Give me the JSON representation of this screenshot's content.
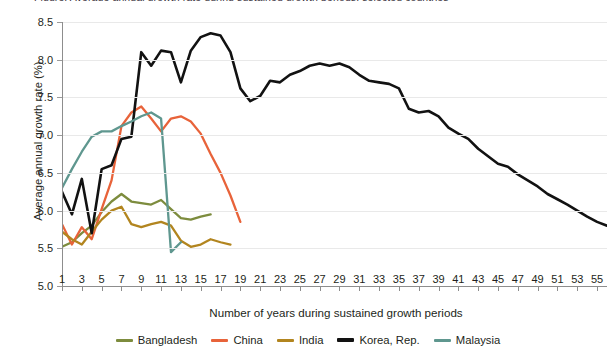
{
  "chart": {
    "title_clipped": "Figure: Average annual growth rate during sustained growth periods, selected countries",
    "xlabel": "Number of years during sustained growth periods",
    "ylabel": "Average annual growth rate (%)",
    "yticks": [
      "5.0",
      "5.5",
      "6.0",
      "6.5",
      "7.0",
      "7.5",
      "8.0",
      "8.5"
    ],
    "xticks": [
      "1",
      "3",
      "5",
      "7",
      "9",
      "11",
      "13",
      "15",
      "17",
      "19",
      "21",
      "23",
      "25",
      "27",
      "29",
      "31",
      "33",
      "35",
      "37",
      "39",
      "41",
      "43",
      "45",
      "47",
      "49",
      "51",
      "53",
      "55"
    ]
  },
  "legend": {
    "items": [
      {
        "label": "Bangladesh",
        "color": "#7d8c3e"
      },
      {
        "label": "China",
        "color": "#e8633a"
      },
      {
        "label": "India",
        "color": "#b2851f"
      },
      {
        "label": "Korea, Rep.",
        "color": "#121212"
      },
      {
        "label": "Malaysia",
        "color": "#5f978f"
      }
    ]
  },
  "chart_data": {
    "type": "line",
    "title": "Average annual growth rate during sustained growth periods, selected countries",
    "xlabel": "Number of years during sustained growth periods",
    "ylabel": "Average annual growth rate (%)",
    "xlim": [
      1,
      56
    ],
    "ylim": [
      5.0,
      8.5
    ],
    "ytick_values": [
      5.0,
      5.5,
      6.0,
      6.5,
      7.0,
      7.5,
      8.0,
      8.5
    ],
    "xtick_values": [
      1,
      3,
      5,
      7,
      9,
      11,
      13,
      15,
      17,
      19,
      21,
      23,
      25,
      27,
      29,
      31,
      33,
      35,
      37,
      39,
      41,
      43,
      45,
      47,
      49,
      51,
      53,
      55
    ],
    "grid": "horizontal",
    "legend_position": "bottom",
    "series": [
      {
        "name": "Bangladesh",
        "color": "#7d8c3e",
        "x": [
          1,
          2,
          3,
          4,
          5,
          6,
          7,
          8,
          9,
          10,
          11,
          12,
          13,
          14,
          15,
          16
        ],
        "y": [
          5.52,
          5.58,
          5.7,
          5.8,
          5.98,
          6.12,
          6.22,
          6.12,
          6.1,
          6.08,
          6.14,
          6.02,
          5.9,
          5.88,
          5.92,
          5.95
        ]
      },
      {
        "name": "China",
        "color": "#e8633a",
        "x": [
          1,
          2,
          3,
          4,
          5,
          6,
          7,
          8,
          9,
          10,
          11,
          12,
          13,
          14,
          15,
          16,
          17,
          18,
          19
        ],
        "y": [
          5.82,
          5.55,
          5.78,
          5.62,
          6.02,
          6.4,
          7.12,
          7.3,
          7.38,
          7.22,
          7.05,
          7.22,
          7.25,
          7.18,
          7.02,
          6.75,
          6.5,
          6.2,
          5.85
        ]
      },
      {
        "name": "India",
        "color": "#b2851f",
        "x": [
          1,
          2,
          3,
          4,
          5,
          6,
          7,
          8,
          9,
          10,
          11,
          12,
          13,
          14,
          15,
          16,
          17,
          18
        ],
        "y": [
          5.72,
          5.62,
          5.55,
          5.72,
          5.88,
          6.0,
          6.05,
          5.82,
          5.78,
          5.82,
          5.85,
          5.8,
          5.6,
          5.52,
          5.55,
          5.62,
          5.58,
          5.55
        ]
      },
      {
        "name": "Korea, Rep.",
        "color": "#121212",
        "x": [
          1,
          2,
          3,
          4,
          5,
          6,
          7,
          8,
          9,
          10,
          11,
          12,
          13,
          14,
          15,
          16,
          17,
          18,
          19,
          20,
          21,
          22,
          23,
          24,
          25,
          26,
          27,
          28,
          29,
          30,
          31,
          32,
          33,
          34,
          35,
          36,
          37,
          38,
          39,
          40,
          41,
          42,
          43,
          44,
          45,
          46,
          47,
          48,
          49,
          50,
          51,
          52,
          53,
          54,
          55,
          56
        ],
        "y": [
          6.25,
          5.95,
          6.42,
          5.7,
          6.55,
          6.6,
          6.95,
          6.98,
          8.1,
          7.92,
          8.12,
          8.1,
          7.7,
          8.12,
          8.3,
          8.35,
          8.32,
          8.1,
          7.62,
          7.45,
          7.52,
          7.72,
          7.7,
          7.8,
          7.85,
          7.92,
          7.95,
          7.92,
          7.95,
          7.9,
          7.8,
          7.72,
          7.7,
          7.68,
          7.62,
          7.35,
          7.3,
          7.32,
          7.25,
          7.1,
          7.02,
          6.95,
          6.82,
          6.72,
          6.62,
          6.58,
          6.48,
          6.4,
          6.32,
          6.22,
          6.15,
          6.08,
          6.0,
          5.92,
          5.85,
          5.8
        ]
      },
      {
        "name": "Malaysia",
        "color": "#5f978f",
        "x": [
          1,
          2,
          3,
          4,
          5,
          6,
          7,
          8,
          9,
          10,
          11,
          12,
          13
        ],
        "y": [
          6.3,
          6.55,
          6.78,
          6.98,
          7.05,
          7.05,
          7.12,
          7.18,
          7.25,
          7.3,
          7.22,
          5.45,
          5.58
        ]
      }
    ]
  }
}
